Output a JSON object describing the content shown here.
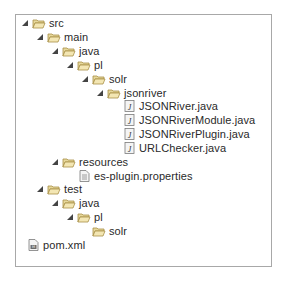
{
  "tree": {
    "nodes": [
      {
        "label": "src",
        "type": "folder",
        "expanded": true,
        "depth": 0
      },
      {
        "label": "main",
        "type": "folder",
        "expanded": true,
        "depth": 1
      },
      {
        "label": "java",
        "type": "folder",
        "expanded": true,
        "depth": 2
      },
      {
        "label": "pl",
        "type": "folder",
        "expanded": true,
        "depth": 3
      },
      {
        "label": "solr",
        "type": "folder",
        "expanded": true,
        "depth": 4
      },
      {
        "label": "jsonriver",
        "type": "folder",
        "expanded": true,
        "depth": 5
      },
      {
        "label": "JSONRiver.java",
        "type": "java-file",
        "depth": 6
      },
      {
        "label": "JSONRiverModule.java",
        "type": "java-file",
        "depth": 6
      },
      {
        "label": "JSONRiverPlugin.java",
        "type": "java-file",
        "depth": 6
      },
      {
        "label": "URLChecker.java",
        "type": "java-file",
        "depth": 6
      },
      {
        "label": "resources",
        "type": "folder",
        "expanded": true,
        "depth": 2
      },
      {
        "label": "es-plugin.properties",
        "type": "properties-file",
        "depth": 3
      },
      {
        "label": "test",
        "type": "folder",
        "expanded": true,
        "depth": 1
      },
      {
        "label": "java",
        "type": "folder",
        "expanded": true,
        "depth": 2
      },
      {
        "label": "pl",
        "type": "folder",
        "expanded": true,
        "depth": 3
      },
      {
        "label": "solr",
        "type": "folder",
        "expanded": false,
        "leaf": true,
        "depth": 4
      },
      {
        "label": "pom.xml",
        "type": "xml-file",
        "depth": 0
      }
    ]
  },
  "colors": {
    "border": "#a8a8a8",
    "folder": "#d9c27a",
    "text": "#2a2a2a"
  }
}
